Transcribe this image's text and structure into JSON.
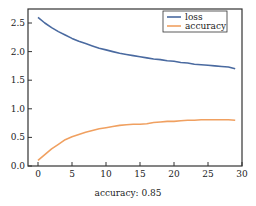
{
  "chart_data": {
    "type": "line",
    "title": "",
    "xlabel": "",
    "ylabel": "",
    "xlim": [
      -1.5,
      30
    ],
    "ylim": [
      0.0,
      2.73
    ],
    "xticks": [
      0,
      5,
      10,
      15,
      20,
      25,
      30
    ],
    "yticks": [
      0.0,
      0.5,
      1.0,
      1.5,
      2.0,
      2.5
    ],
    "xtick_labels": [
      "0",
      "5",
      "10",
      "15",
      "20",
      "25",
      "30"
    ],
    "ytick_labels": [
      "0.0",
      "0.5",
      "1.0",
      "1.5",
      "2.0",
      "2.5"
    ],
    "grid": false,
    "legend_position": "top-right",
    "x": [
      0,
      1,
      2,
      3,
      4,
      5,
      6,
      7,
      8,
      9,
      10,
      11,
      12,
      13,
      14,
      15,
      16,
      17,
      18,
      19,
      20,
      21,
      22,
      23,
      24,
      25,
      26,
      27,
      28,
      29
    ],
    "series": [
      {
        "name": "loss",
        "color": "#4a6aa0",
        "values": [
          2.6,
          2.5,
          2.42,
          2.35,
          2.29,
          2.23,
          2.18,
          2.14,
          2.1,
          2.06,
          2.03,
          2.0,
          1.97,
          1.95,
          1.93,
          1.91,
          1.89,
          1.87,
          1.86,
          1.84,
          1.83,
          1.81,
          1.8,
          1.78,
          1.77,
          1.76,
          1.75,
          1.74,
          1.73,
          1.7
        ]
      },
      {
        "name": "accuracy",
        "color": "#f0a060",
        "values": [
          0.1,
          0.2,
          0.3,
          0.38,
          0.46,
          0.51,
          0.55,
          0.59,
          0.62,
          0.65,
          0.67,
          0.69,
          0.71,
          0.72,
          0.73,
          0.73,
          0.74,
          0.76,
          0.77,
          0.78,
          0.78,
          0.79,
          0.8,
          0.8,
          0.81,
          0.81,
          0.81,
          0.81,
          0.81,
          0.8
        ]
      }
    ],
    "caption": "accuracy: 0.85"
  }
}
